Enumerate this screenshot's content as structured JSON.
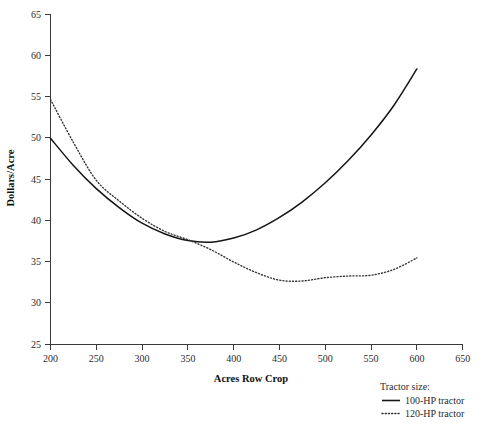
{
  "chart_data": {
    "type": "line",
    "title": "",
    "xlabel": "Acres Row Crop",
    "ylabel": "Dollars/Acre",
    "xlim": [
      200,
      650
    ],
    "ylim": [
      25,
      65
    ],
    "xticks": [
      200,
      250,
      300,
      350,
      400,
      450,
      500,
      550,
      600,
      650
    ],
    "yticks": [
      25,
      30,
      35,
      40,
      45,
      50,
      55,
      60,
      65
    ],
    "grid": false,
    "legend_position": "bottom-right",
    "legend_title": "Tractor size:",
    "x": [
      200,
      225,
      250,
      275,
      300,
      325,
      350,
      375,
      400,
      425,
      450,
      475,
      500,
      525,
      550,
      575,
      600
    ],
    "series": [
      {
        "name": "100-HP tractor",
        "style": "solid",
        "color": "#151515",
        "values": [
          50.0,
          46.7,
          43.9,
          41.6,
          39.7,
          38.4,
          37.6,
          37.4,
          37.9,
          38.9,
          40.4,
          42.3,
          44.6,
          47.3,
          50.4,
          54.0,
          58.4
        ]
      },
      {
        "name": "120-HP tractor",
        "style": "dotted",
        "color": "#303030",
        "values": [
          54.7,
          49.5,
          44.9,
          42.4,
          40.3,
          38.7,
          37.7,
          36.5,
          35.0,
          33.7,
          32.8,
          32.7,
          33.1,
          33.3,
          33.4,
          34.1,
          35.5
        ]
      }
    ],
    "annotations": []
  },
  "axes": {
    "y_label": "Dollars/Acre",
    "x_label": "Acres Row Crop",
    "y_tick_labels": [
      "65",
      "60",
      "55",
      "50",
      "45",
      "40",
      "35",
      "30",
      "25"
    ],
    "x_tick_labels": [
      "200",
      "250",
      "300",
      "350",
      "400",
      "450",
      "500",
      "550",
      "600",
      "650"
    ]
  },
  "legend": {
    "title": "Tractor size:",
    "entries": [
      {
        "label": "100-HP tractor",
        "style": "solid"
      },
      {
        "label": "120-HP tractor",
        "style": "dotted"
      }
    ]
  }
}
